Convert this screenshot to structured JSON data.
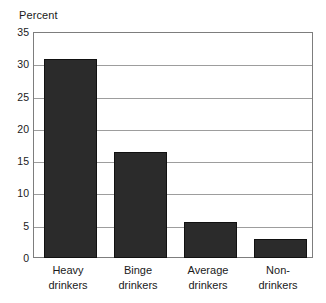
{
  "chart_data": {
    "type": "bar",
    "title": "",
    "ylabel": "Percent",
    "xlabel": "",
    "categories": [
      "Heavy drinkers",
      "Binge drinkers",
      "Average drinkers",
      "Non-drinkers"
    ],
    "category_lines": [
      [
        "Heavy",
        "drinkers"
      ],
      [
        "Binge",
        "drinkers"
      ],
      [
        "Average",
        "drinkers"
      ],
      [
        "Non-",
        "drinkers"
      ]
    ],
    "values": [
      30.8,
      16.4,
      5.6,
      2.9
    ],
    "ylim": [
      0,
      35
    ],
    "yticks": [
      35,
      30,
      25,
      20,
      15,
      10,
      5,
      0
    ],
    "ytick_labels": [
      "35",
      "30",
      "25",
      "20",
      "15",
      "10",
      "5",
      "0"
    ],
    "grid": true,
    "grid_axis": "y",
    "legend": null,
    "bar_color": "#2b2b2b",
    "grid_color": "#9d9d9d",
    "frame_color": "#7d7d7d",
    "text_color": "#1a1a1a"
  }
}
